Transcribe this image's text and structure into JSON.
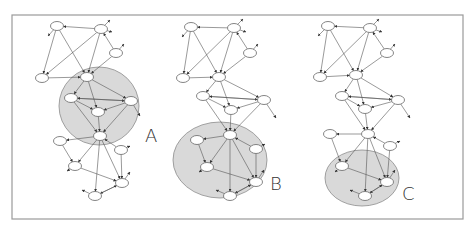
{
  "figure": {
    "frame": {
      "x": 12,
      "y": 15,
      "w": 451,
      "h": 204
    },
    "panels": [
      {
        "id": "A",
        "label": "A",
        "label_pos": [
          145,
          142
        ],
        "region": {
          "cx": 99,
          "cy": 106,
          "rx": 40,
          "ry": 39
        },
        "nodes": [
          [
            57,
            26
          ],
          [
            101,
            29
          ],
          [
            116,
            53
          ],
          [
            42,
            78
          ],
          [
            87,
            77
          ],
          [
            71,
            98
          ],
          [
            98,
            112
          ],
          [
            131,
            101
          ],
          [
            60,
            141
          ],
          [
            100,
            136
          ],
          [
            121,
            150
          ],
          [
            75,
            166
          ],
          [
            122,
            183
          ],
          [
            95,
            196
          ]
        ],
        "edges": [
          [
            1,
            0
          ],
          [
            0,
            3
          ],
          [
            1,
            3
          ],
          [
            1,
            4
          ],
          [
            0,
            4
          ],
          [
            2,
            4
          ],
          [
            2,
            1
          ],
          [
            3,
            4
          ],
          [
            4,
            5
          ],
          [
            4,
            6
          ],
          [
            4,
            7
          ],
          [
            5,
            7
          ],
          [
            7,
            5
          ],
          [
            5,
            6
          ],
          [
            7,
            6
          ],
          [
            6,
            9
          ],
          [
            7,
            9
          ],
          [
            5,
            9
          ],
          [
            9,
            8
          ],
          [
            8,
            11
          ],
          [
            9,
            11
          ],
          [
            9,
            12
          ],
          [
            9,
            13
          ],
          [
            10,
            9
          ],
          [
            11,
            12
          ],
          [
            12,
            13
          ],
          [
            13,
            12
          ],
          [
            10,
            12
          ]
        ],
        "stubs": [
          [
            101,
            29,
            110,
            20
          ],
          [
            101,
            29,
            112,
            32
          ],
          [
            116,
            53,
            124,
            44
          ],
          [
            131,
            101,
            140,
            116
          ],
          [
            121,
            150,
            130,
            146
          ],
          [
            122,
            183,
            130,
            172
          ],
          [
            95,
            196,
            82,
            190
          ],
          [
            57,
            26,
            48,
            36
          ],
          [
            75,
            166,
            67,
            171
          ]
        ]
      },
      {
        "id": "B",
        "label": "B",
        "label_pos": [
          270,
          190
        ],
        "region": {
          "cx": 220,
          "cy": 160,
          "rx": 47,
          "ry": 38
        },
        "nodes": [
          [
            191,
            27
          ],
          [
            234,
            28
          ],
          [
            250,
            53
          ],
          [
            183,
            78
          ],
          [
            219,
            77
          ],
          [
            203,
            96
          ],
          [
            231,
            110
          ],
          [
            264,
            100
          ],
          [
            197,
            140
          ],
          [
            230,
            135
          ],
          [
            256,
            149
          ],
          [
            207,
            167
          ],
          [
            256,
            182
          ],
          [
            230,
            196
          ]
        ],
        "edges": [
          [
            1,
            0
          ],
          [
            0,
            3
          ],
          [
            1,
            3
          ],
          [
            1,
            4
          ],
          [
            0,
            4
          ],
          [
            2,
            4
          ],
          [
            2,
            1
          ],
          [
            3,
            4
          ],
          [
            4,
            5
          ],
          [
            4,
            6
          ],
          [
            4,
            7
          ],
          [
            5,
            7
          ],
          [
            7,
            5
          ],
          [
            5,
            6
          ],
          [
            7,
            6
          ],
          [
            6,
            9
          ],
          [
            7,
            9
          ],
          [
            5,
            9
          ],
          [
            9,
            8
          ],
          [
            8,
            11
          ],
          [
            9,
            11
          ],
          [
            9,
            12
          ],
          [
            9,
            13
          ],
          [
            10,
            9
          ],
          [
            11,
            12
          ],
          [
            12,
            13
          ],
          [
            13,
            12
          ],
          [
            10,
            12
          ]
        ],
        "stubs": [
          [
            234,
            28,
            243,
            19
          ],
          [
            234,
            28,
            246,
            32
          ],
          [
            250,
            53,
            258,
            44
          ],
          [
            264,
            100,
            276,
            118
          ],
          [
            256,
            149,
            265,
            144
          ],
          [
            256,
            182,
            264,
            170
          ],
          [
            230,
            196,
            216,
            190
          ],
          [
            191,
            27,
            182,
            37
          ],
          [
            207,
            167,
            199,
            172
          ]
        ]
      },
      {
        "id": "C",
        "label": "C",
        "label_pos": [
          402,
          200
        ],
        "region": {
          "cx": 362,
          "cy": 178,
          "rx": 37,
          "ry": 28
        },
        "nodes": [
          [
            328,
            26
          ],
          [
            370,
            28
          ],
          [
            387,
            53
          ],
          [
            320,
            77
          ],
          [
            356,
            75
          ],
          [
            342,
            96
          ],
          [
            365,
            109
          ],
          [
            398,
            100
          ],
          [
            330,
            134
          ],
          [
            368,
            134
          ],
          [
            390,
            146
          ],
          [
            342,
            166
          ],
          [
            387,
            182
          ],
          [
            365,
            196
          ]
        ],
        "edges": [
          [
            1,
            0
          ],
          [
            0,
            3
          ],
          [
            1,
            3
          ],
          [
            1,
            4
          ],
          [
            0,
            4
          ],
          [
            2,
            4
          ],
          [
            2,
            1
          ],
          [
            3,
            4
          ],
          [
            4,
            5
          ],
          [
            4,
            6
          ],
          [
            4,
            7
          ],
          [
            5,
            7
          ],
          [
            7,
            5
          ],
          [
            5,
            6
          ],
          [
            7,
            6
          ],
          [
            6,
            9
          ],
          [
            7,
            9
          ],
          [
            5,
            9
          ],
          [
            9,
            8
          ],
          [
            8,
            11
          ],
          [
            9,
            11
          ],
          [
            9,
            12
          ],
          [
            9,
            13
          ],
          [
            10,
            9
          ],
          [
            11,
            12
          ],
          [
            12,
            13
          ],
          [
            13,
            12
          ],
          [
            10,
            12
          ]
        ],
        "stubs": [
          [
            370,
            28,
            379,
            19
          ],
          [
            370,
            28,
            382,
            32
          ],
          [
            387,
            53,
            395,
            44
          ],
          [
            398,
            100,
            410,
            118
          ],
          [
            390,
            146,
            400,
            141
          ],
          [
            387,
            182,
            395,
            170
          ],
          [
            365,
            196,
            350,
            190
          ],
          [
            328,
            26,
            318,
            36
          ],
          [
            342,
            166,
            335,
            172
          ]
        ]
      }
    ]
  }
}
